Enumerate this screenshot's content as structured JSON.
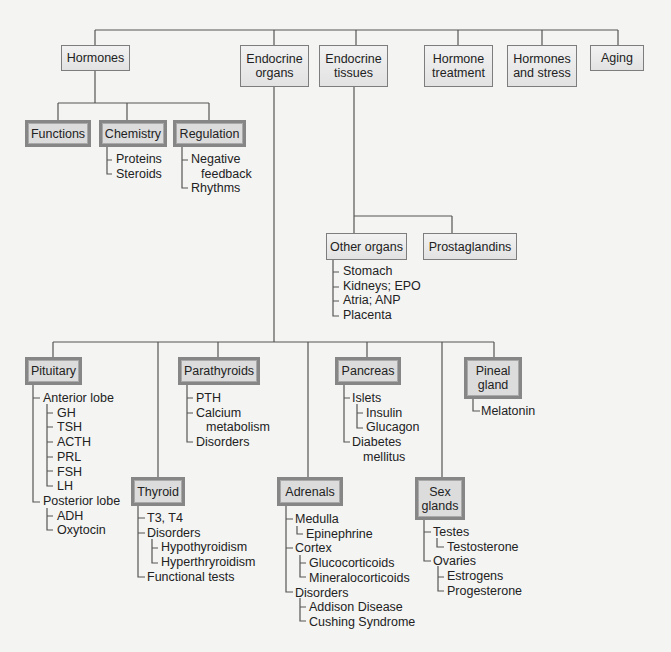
{
  "colors": {
    "background": "#f4f4f3",
    "line": "#555555",
    "light_box": "#e8e8e8",
    "dark_box_border": "#868686"
  },
  "top_level": [
    {
      "id": "hormones",
      "label": "Hormones",
      "style": "light"
    },
    {
      "id": "endocrine-organs",
      "label": "Endocrine\norgans",
      "style": "light"
    },
    {
      "id": "endocrine-tissues",
      "label": "Endocrine\ntissues",
      "style": "light"
    },
    {
      "id": "hormone-treatment",
      "label": "Hormone\ntreatment",
      "style": "light"
    },
    {
      "id": "hormones-and-stress",
      "label": "Hormones\nand stress",
      "style": "light"
    },
    {
      "id": "aging",
      "label": "Aging",
      "style": "light"
    }
  ],
  "hormones_children": [
    {
      "id": "functions",
      "label": "Functions",
      "style": "dark",
      "items": []
    },
    {
      "id": "chemistry",
      "label": "Chemistry",
      "style": "dark",
      "items": [
        "Proteins",
        "Steroids"
      ]
    },
    {
      "id": "regulation",
      "label": "Regulation",
      "style": "dark",
      "items": [
        "Negative",
        "feedback",
        "Rhythms"
      ]
    }
  ],
  "tissues_children": [
    {
      "id": "other-organs",
      "label": "Other organs",
      "style": "light",
      "items": [
        "Stomach",
        "Kidneys; EPO",
        "Atria; ANP",
        "Placenta"
      ]
    },
    {
      "id": "prostaglandins",
      "label": "Prostaglandins",
      "style": "light",
      "items": []
    }
  ],
  "organs_children": {
    "pituitary": {
      "label": "Pituitary",
      "items": [
        "Anterior lobe",
        "GH",
        "TSH",
        "ACTH",
        "PRL",
        "FSH",
        "LH",
        "Posterior lobe",
        "ADH",
        "Oxytocin"
      ]
    },
    "thyroid": {
      "label": "Thyroid",
      "items": [
        "T3, T4",
        "Disorders",
        "Hypothyroidism",
        "Hyperthryroidism",
        "Functional tests"
      ]
    },
    "parathyroids": {
      "label": "Parathyroids",
      "items": [
        "PTH",
        "Calcium",
        "metabolism",
        "Disorders"
      ]
    },
    "adrenals": {
      "label": "Adrenals",
      "items": [
        "Medulla",
        "Epinephrine",
        "Cortex",
        "Glucocorticoids",
        "Mineralocorticoids",
        "Disorders",
        "Addison Disease",
        "Cushing Syndrome"
      ]
    },
    "pancreas": {
      "label": "Pancreas",
      "items": [
        "Islets",
        "Insulin",
        "Glucagon",
        "Diabetes",
        "mellitus"
      ]
    },
    "sex_glands": {
      "label": "Sex\nglands",
      "items": [
        "Testes",
        "Testosterone",
        "Ovaries",
        "Estrogens",
        "Progesterone"
      ]
    },
    "pineal": {
      "label": "Pineal\ngland",
      "items": [
        "Melatonin"
      ]
    }
  }
}
